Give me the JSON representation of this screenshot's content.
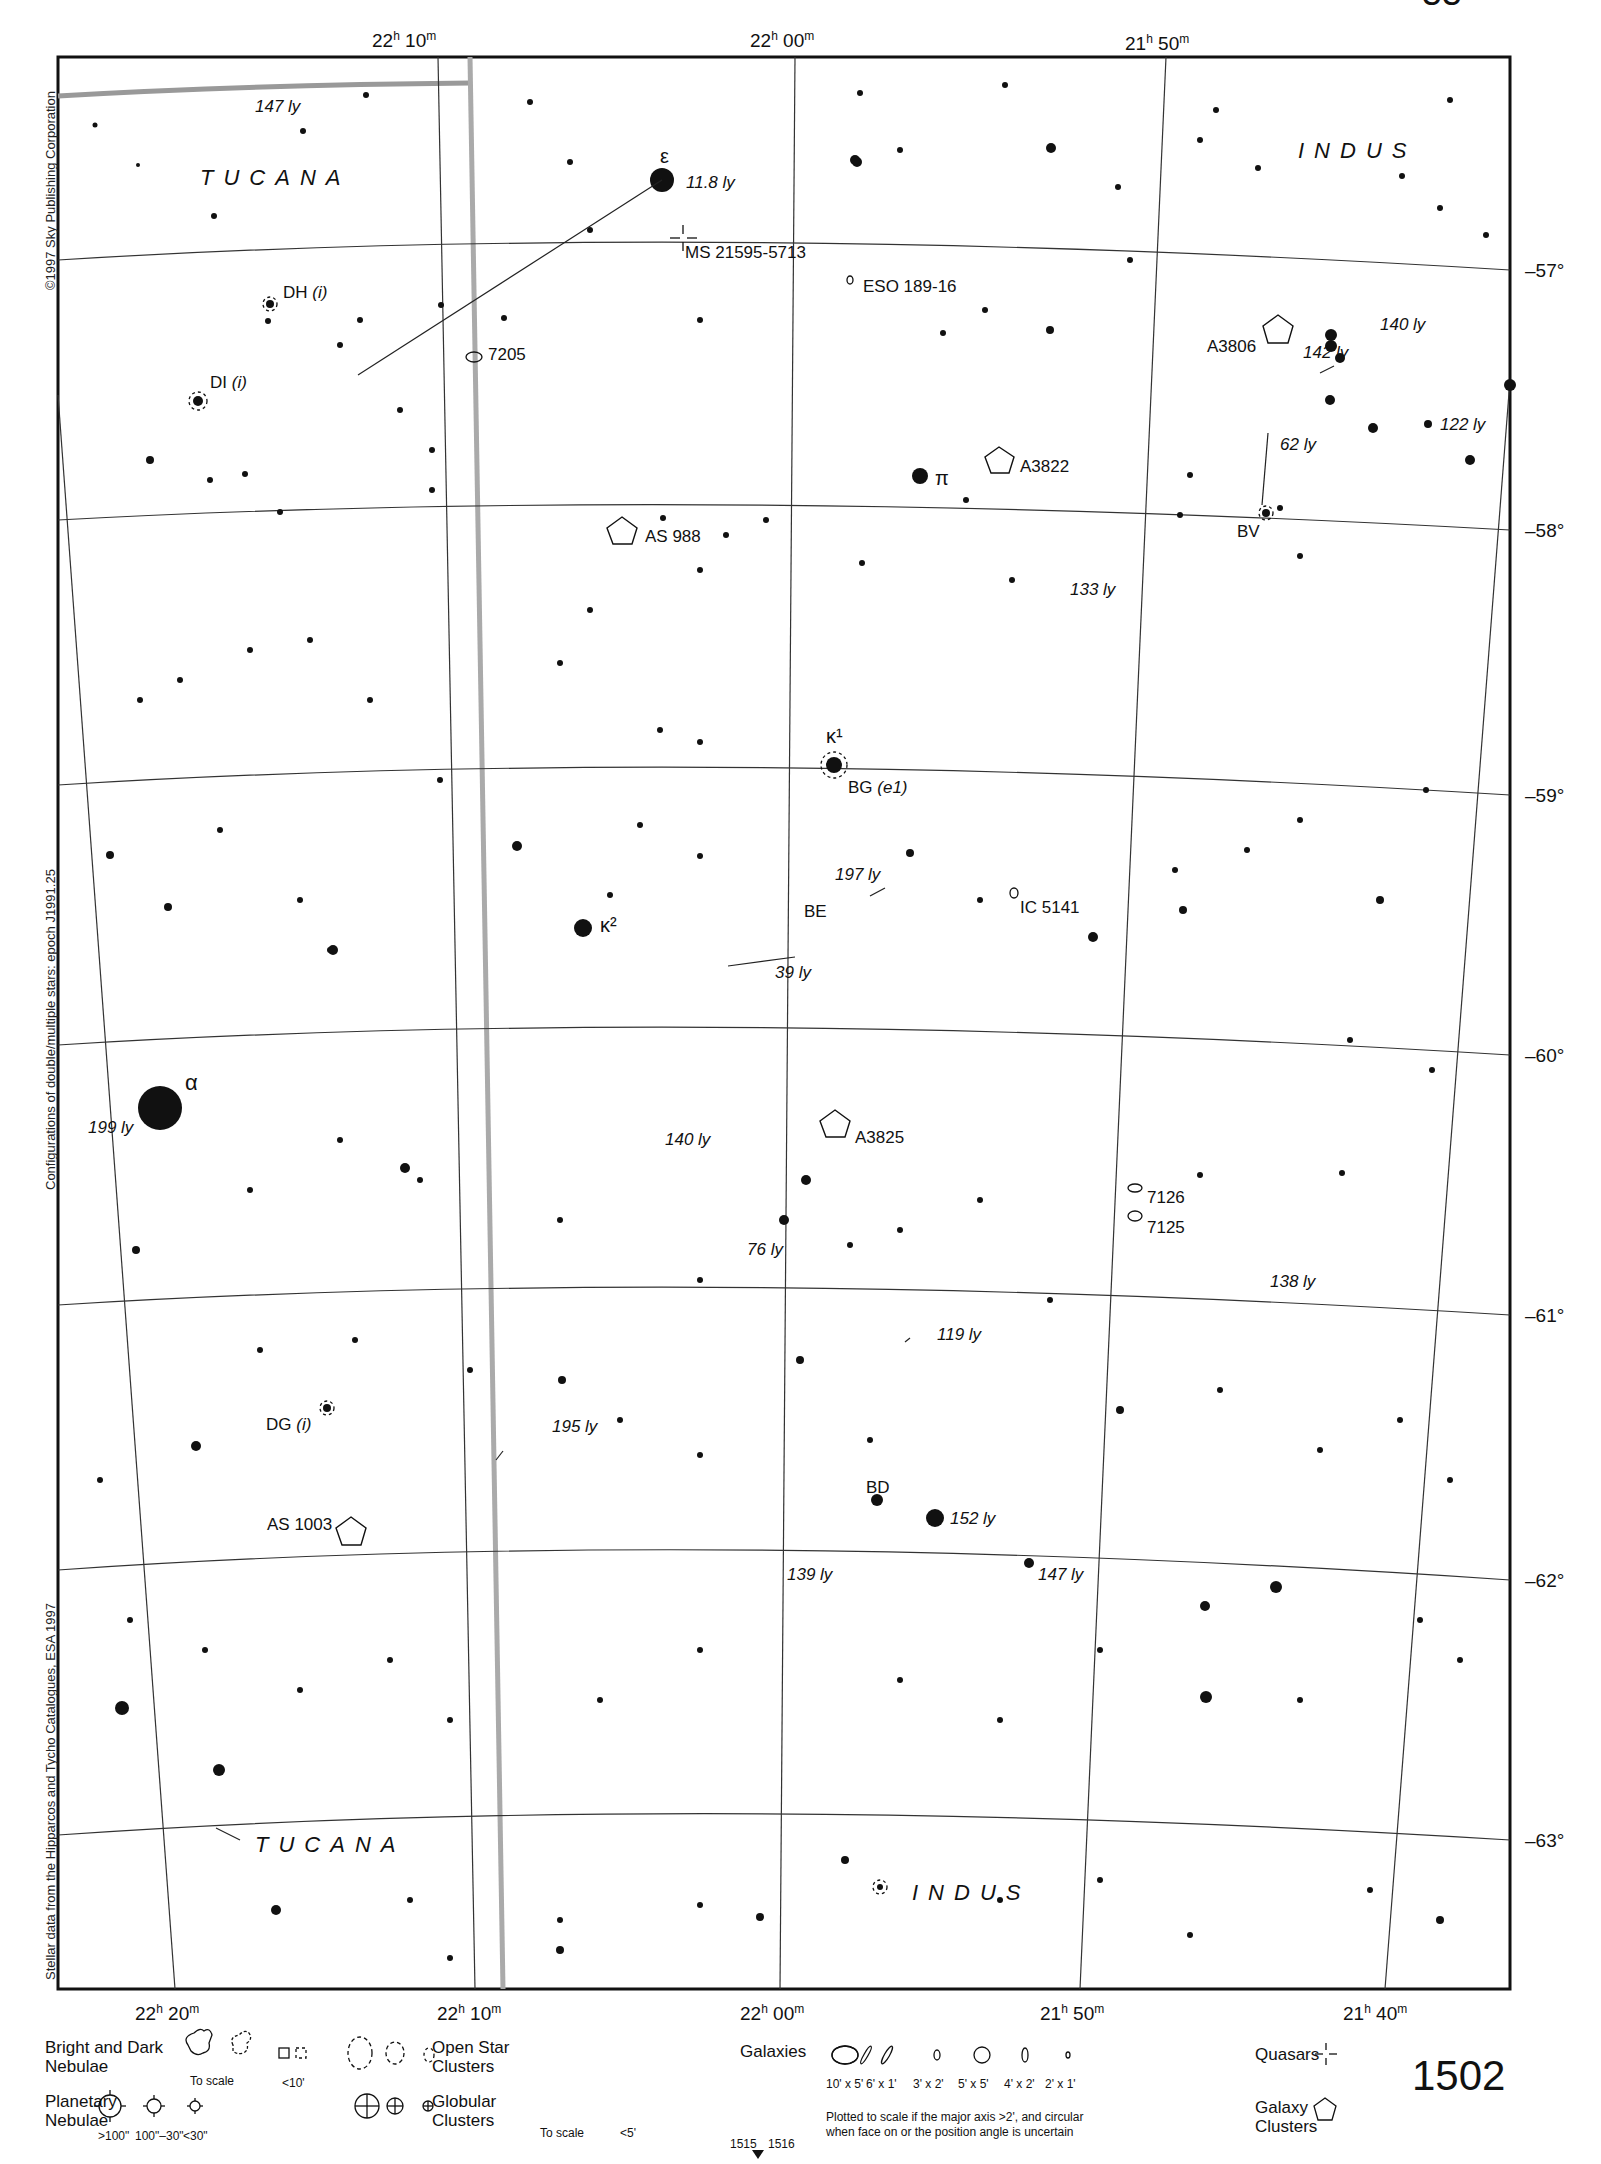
{
  "page": {
    "chart_number": "1502",
    "top_page_fragment": "55",
    "adjacent_charts": [
      "1515",
      "1516"
    ]
  },
  "side_credits": {
    "copyright": "©1997 Sky Publishing Corporation",
    "epoch_note": "Configurations of double/multiple stars: epoch J1991.25",
    "data_source": "Stellar data from the Hipparcos and Tycho Catalogues, ESA 1997"
  },
  "axes": {
    "ra_top": [
      {
        "h": "22",
        "m": "10",
        "x": 415
      },
      {
        "h": "22",
        "m": "00",
        "x": 790
      },
      {
        "h": "21",
        "m": "50",
        "x": 1165
      }
    ],
    "ra_bottom": [
      {
        "h": "22",
        "m": "20",
        "x": 175
      },
      {
        "h": "22",
        "m": "10",
        "x": 485
      },
      {
        "h": "22",
        "m": "00",
        "x": 790
      },
      {
        "h": "21",
        "m": "50",
        "x": 1085
      },
      {
        "h": "21",
        "m": "40",
        "x": 1385
      }
    ],
    "dec_right": [
      {
        "label": "–57°",
        "y": 270
      },
      {
        "label": "–58°",
        "y": 530
      },
      {
        "label": "–59°",
        "y": 795
      },
      {
        "label": "–60°",
        "y": 1055
      },
      {
        "label": "–61°",
        "y": 1315
      },
      {
        "label": "–62°",
        "y": 1580
      },
      {
        "label": "–63°",
        "y": 1840
      }
    ],
    "h_sup": "h",
    "m_sup": "m"
  },
  "constellations": [
    {
      "name": "TUCANA",
      "x": 200,
      "y": 185
    },
    {
      "name": "INDUS",
      "x": 1298,
      "y": 158
    },
    {
      "name": "TUCANA",
      "x": 255,
      "y": 1852
    },
    {
      "name": "INDUS",
      "x": 912,
      "y": 1900
    }
  ],
  "star_labels": [
    {
      "text": "ε",
      "x": 660,
      "y": 163,
      "greek": true
    },
    {
      "text": "π",
      "x": 935,
      "y": 485,
      "greek": true
    },
    {
      "text": "κ¹",
      "x": 826,
      "y": 743,
      "greek": true
    },
    {
      "text": "κ²",
      "x": 600,
      "y": 932,
      "greek": true
    },
    {
      "text": "α",
      "x": 185,
      "y": 1090,
      "greek": true
    }
  ],
  "distance_labels": [
    {
      "text": "147 ly",
      "x": 255,
      "y": 112
    },
    {
      "text": "11.8 ly",
      "x": 686,
      "y": 188
    },
    {
      "text": "140 ly",
      "x": 1380,
      "y": 330
    },
    {
      "text": "142 ly",
      "x": 1303,
      "y": 358
    },
    {
      "text": "122 ly",
      "x": 1440,
      "y": 430
    },
    {
      "text": "62 ly",
      "x": 1280,
      "y": 450
    },
    {
      "text": "133 ly",
      "x": 1070,
      "y": 595
    },
    {
      "text": "197 ly",
      "x": 835,
      "y": 880
    },
    {
      "text": "39 ly",
      "x": 775,
      "y": 978
    },
    {
      "text": "199 ly",
      "x": 88,
      "y": 1133
    },
    {
      "text": "140 ly",
      "x": 665,
      "y": 1145
    },
    {
      "text": "76 ly",
      "x": 747,
      "y": 1255
    },
    {
      "text": "138 ly",
      "x": 1270,
      "y": 1287
    },
    {
      "text": "119 ly",
      "x": 937,
      "y": 1340
    },
    {
      "text": "195 ly",
      "x": 552,
      "y": 1432
    },
    {
      "text": "152 ly",
      "x": 950,
      "y": 1524
    },
    {
      "text": "139 ly",
      "x": 787,
      "y": 1580
    },
    {
      "text": "147 ly",
      "x": 1038,
      "y": 1580
    }
  ],
  "variable_star_labels": [
    {
      "text": "DH",
      "suffix": "(i)",
      "x": 283,
      "y": 298
    },
    {
      "text": "DI",
      "suffix": "(i)",
      "x": 210,
      "y": 388
    },
    {
      "text": "BV",
      "suffix": "",
      "x": 1237,
      "y": 537
    },
    {
      "text": "BG",
      "suffix": "(e1)",
      "x": 848,
      "y": 793
    },
    {
      "text": "BE",
      "suffix": "",
      "x": 804,
      "y": 917
    },
    {
      "text": "DG",
      "suffix": "(i)",
      "x": 266,
      "y": 1430
    },
    {
      "text": "BD",
      "suffix": "",
      "x": 866,
      "y": 1493
    }
  ],
  "deep_sky_labels": [
    {
      "text": "MS 21595-5713",
      "type": "quasar",
      "x": 685,
      "y": 258
    },
    {
      "text": "ESO 189-16",
      "type": "galaxy",
      "x": 863,
      "y": 292
    },
    {
      "text": "7205",
      "type": "galaxy",
      "x": 488,
      "y": 360
    },
    {
      "text": "A3806",
      "type": "galaxy-cluster",
      "x": 1207,
      "y": 352
    },
    {
      "text": "A3822",
      "type": "galaxy-cluster",
      "x": 1020,
      "y": 472
    },
    {
      "text": "AS 988",
      "type": "galaxy-cluster",
      "x": 645,
      "y": 542
    },
    {
      "text": "IC 5141",
      "type": "galaxy",
      "x": 1020,
      "y": 913
    },
    {
      "text": "A3825",
      "type": "galaxy-cluster",
      "x": 855,
      "y": 1143
    },
    {
      "text": "7126",
      "type": "galaxy",
      "x": 1147,
      "y": 1203
    },
    {
      "text": "7125",
      "type": "galaxy",
      "x": 1147,
      "y": 1233
    },
    {
      "text": "AS 1003",
      "type": "galaxy-cluster",
      "x": 267,
      "y": 1530
    }
  ],
  "legend": {
    "nebulae": {
      "label_line1": "Bright and Dark",
      "label_line2": "Nebulae",
      "to_scale": "To scale",
      "small": "<10'"
    },
    "planetary": {
      "label_line1": "Planetary",
      "label_line2": "Nebulae",
      "sizes": [
        ">100\"",
        "100\"–30\"",
        "<30\""
      ]
    },
    "open_clusters": {
      "label_line1": "Open Star",
      "label_line2": "Clusters"
    },
    "globular": {
      "label_line1": "Globular",
      "label_line2": "Clusters",
      "to_scale": "To scale",
      "small": "<5'"
    },
    "galaxies": {
      "label": "Galaxies",
      "sizes": [
        "10' x 5'",
        "6' x 1'",
        "3' x 2'",
        "5' x 5'",
        "4' x 2'",
        "2' x 1'"
      ],
      "note_line1": "Plotted to scale if the major axis >2', and circular",
      "note_line2": "when face on or the position angle is uncertain"
    },
    "quasars": {
      "label": "Quasars"
    },
    "galaxy_clusters": {
      "label_line1": "Galaxy",
      "label_line2": "Clusters"
    }
  }
}
